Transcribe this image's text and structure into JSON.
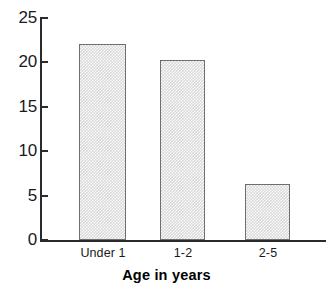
{
  "chart_data": {
    "type": "bar",
    "title": "",
    "xlabel": "Age in years",
    "ylabel": "",
    "categories": [
      "Under 1",
      "1-2",
      "2-5"
    ],
    "values": [
      22.0,
      20.2,
      6.3
    ],
    "ylim": [
      0,
      25
    ],
    "ytick_labels": [
      "0",
      "5",
      "10",
      "15",
      "20",
      "25"
    ],
    "ytick_values": [
      0,
      5,
      10,
      15,
      20,
      25
    ],
    "grid": false,
    "legend": null,
    "bar_fill_color": "#d9d9d9",
    "bar_edge_color": "#6e6e6e",
    "axis_color": "#2b2b2b",
    "background_color": "#ffffff"
  }
}
